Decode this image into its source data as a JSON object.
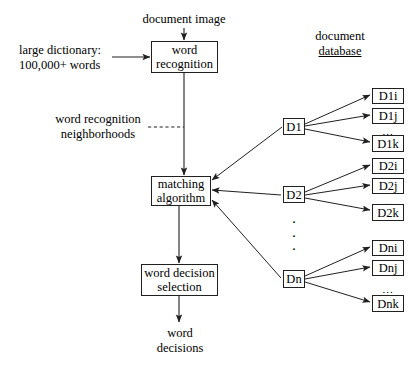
{
  "diagram": {
    "colors": {
      "stroke": "#202020",
      "background": "#ffffff",
      "text": "#000000"
    },
    "inputs": {
      "document_image": "document image",
      "dictionary_line1": "large dictionary:",
      "dictionary_line2": "100,000+ words"
    },
    "annotations": {
      "neighborhoods_line1": "word recognition",
      "neighborhoods_line2": "neighborhoods"
    },
    "database": {
      "heading_line1": "document",
      "heading_line2": "database"
    },
    "process_boxes": [
      {
        "id": "word-recognition",
        "line1": "word",
        "line2": "recognition"
      },
      {
        "id": "matching-algorithm",
        "line1": "matching",
        "line2": "algorithm"
      },
      {
        "id": "word-decision-selection",
        "line1": "word decision",
        "line2": "selection"
      }
    ],
    "output": {
      "line1": "word",
      "line2": "decisions"
    },
    "document_nodes": [
      {
        "id": "D1",
        "label": "D1"
      },
      {
        "id": "D2",
        "label": "D2"
      },
      {
        "id": "Dn",
        "label": "Dn"
      }
    ],
    "document_groups": [
      {
        "parent": "D1",
        "items": [
          {
            "id": "D1i",
            "label": "D1i"
          },
          {
            "id": "D1j",
            "label": "D1j"
          },
          {
            "id": "D1k",
            "label": "D1k"
          }
        ],
        "ellipsis": "..."
      },
      {
        "parent": "D2",
        "items": [
          {
            "id": "D2i",
            "label": "D2i"
          },
          {
            "id": "D2j",
            "label": "D2j"
          },
          {
            "id": "D2k",
            "label": "D2k"
          }
        ],
        "ellipsis": "..."
      },
      {
        "parent": "Dn",
        "items": [
          {
            "id": "Dni",
            "label": "Dni"
          },
          {
            "id": "Dnj",
            "label": "Dnj"
          },
          {
            "id": "Dnk",
            "label": "Dnk"
          }
        ],
        "ellipsis": "..."
      }
    ],
    "vertical_ellipsis": {
      "dot1": "·",
      "dot2": "·",
      "dot3": "·"
    }
  }
}
